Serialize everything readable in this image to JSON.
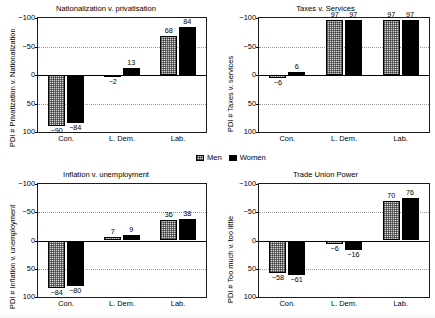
{
  "legend": {
    "men_label": "Men",
    "women_label": "Women"
  },
  "axis": {
    "yticks": [
      "100",
      "50",
      "0",
      "−50",
      "−100"
    ],
    "ytick_values": [
      100,
      50,
      0,
      -50,
      -100
    ],
    "categories": [
      "Con.",
      "L. Dem.",
      "Lab."
    ]
  },
  "panels": [
    {
      "id": "nationalization-v-privatisation",
      "title": "Nationalization v. privatisation",
      "ylabel": "PDI # Privatization v. Nationalization"
    },
    {
      "id": "taxes-v-services",
      "title": "Taxes v. Services",
      "ylabel": "PDI # Taxes v. services"
    },
    {
      "id": "inflation-v-unemployment",
      "title": "Inflation v. unemployment",
      "ylabel": "PDI # Inflation v. unemployment"
    },
    {
      "id": "trade-union-power",
      "title": "Trade Union Power",
      "ylabel": "PDI # Too much v. too little"
    }
  ],
  "chart_data": [
    {
      "type": "bar",
      "title": "Nationalization v. privatisation",
      "xlabel": "",
      "ylabel": "PDI # Privatization v. Nationalization",
      "categories": [
        "Con.",
        "L. Dem.",
        "Lab."
      ],
      "ylim": [
        -100,
        100
      ],
      "yticks": [
        -100,
        -50,
        0,
        50,
        100
      ],
      "grid": true,
      "legend_position": "figure-center",
      "series": [
        {
          "name": "Men",
          "values": [
            -90,
            -2,
            68
          ]
        },
        {
          "name": "Women",
          "values": [
            -84,
            13,
            84
          ]
        }
      ]
    },
    {
      "type": "bar",
      "title": "Taxes v. Services",
      "xlabel": "",
      "ylabel": "PDI # Taxes v. services",
      "categories": [
        "Con.",
        "L. Dem.",
        "Lab."
      ],
      "ylim": [
        -100,
        100
      ],
      "yticks": [
        -100,
        -50,
        0,
        50,
        100
      ],
      "grid": true,
      "legend_position": "figure-center",
      "series": [
        {
          "name": "Men",
          "values": [
            -6,
            97,
            97
          ]
        },
        {
          "name": "Women",
          "values": [
            6,
            97,
            97
          ]
        }
      ]
    },
    {
      "type": "bar",
      "title": "Inflation v. unemployment",
      "xlabel": "",
      "ylabel": "PDI # Inflation v. unemployment",
      "categories": [
        "Con.",
        "L. Dem.",
        "Lab."
      ],
      "ylim": [
        -100,
        100
      ],
      "yticks": [
        -100,
        -50,
        0,
        50,
        100
      ],
      "grid": true,
      "legend_position": "figure-center",
      "series": [
        {
          "name": "Men",
          "values": [
            -84,
            7,
            36
          ]
        },
        {
          "name": "Women",
          "values": [
            -80,
            9,
            38
          ]
        }
      ]
    },
    {
      "type": "bar",
      "title": "Trade Union Power",
      "xlabel": "",
      "ylabel": "PDI # Too much v. too little",
      "categories": [
        "Con.",
        "L. Dem.",
        "Lab."
      ],
      "ylim": [
        -100,
        100
      ],
      "yticks": [
        -100,
        -50,
        0,
        50,
        100
      ],
      "grid": true,
      "legend_position": "figure-center",
      "series": [
        {
          "name": "Men",
          "values": [
            -58,
            -6,
            70
          ]
        },
        {
          "name": "Women",
          "values": [
            -61,
            -16,
            76
          ]
        }
      ]
    }
  ],
  "labels": {
    "p0_men": [
      "−90",
      "−2",
      "68"
    ],
    "p0_women": [
      "−84",
      "13",
      "84"
    ],
    "p1_men": [
      "−6",
      "97",
      "97"
    ],
    "p1_women": [
      "6",
      "97",
      "97"
    ],
    "p2_men": [
      "−84",
      "7",
      "36"
    ],
    "p2_women": [
      "−80",
      "9",
      "38"
    ],
    "p3_men": [
      "−58",
      "−6",
      "70"
    ],
    "p3_women": [
      "−61",
      "−16",
      "76"
    ]
  }
}
